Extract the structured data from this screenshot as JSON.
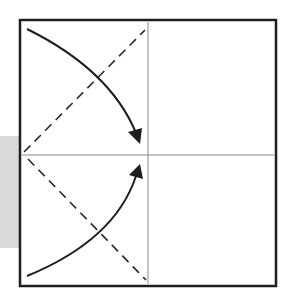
{
  "diagram": {
    "type": "origami-fold-instructions",
    "colors": {
      "background": "#ffffff",
      "border": "#1e1e1e",
      "crease": "#8a8a8a",
      "fold_line": "#2a2a2a",
      "arrow": "#1e1e1e",
      "shadow_shape": "#d9d9d9"
    },
    "square": {
      "x": 20,
      "y": 20,
      "size": 257
    },
    "center": {
      "x": 148,
      "y": 155
    },
    "creases": [
      {
        "name": "vertical-center-crease",
        "x1": 148,
        "y1": 22,
        "x2": 148,
        "y2": 285
      },
      {
        "name": "horizontal-center-crease",
        "x1": 22,
        "y1": 155,
        "x2": 275,
        "y2": 155
      }
    ],
    "valley_folds": [
      {
        "name": "upper-dashed-fold",
        "x1": 24,
        "y1": 152,
        "x2": 145,
        "y2": 30
      },
      {
        "name": "lower-dashed-fold",
        "x1": 28,
        "y1": 159,
        "x2": 146,
        "y2": 280
      }
    ],
    "arrows": [
      {
        "name": "top-corner-arrow",
        "path": "M27 29 Q110 70 139 140"
      },
      {
        "name": "bottom-corner-arrow",
        "path": "M27 276 Q115 240 139 168"
      }
    ]
  }
}
